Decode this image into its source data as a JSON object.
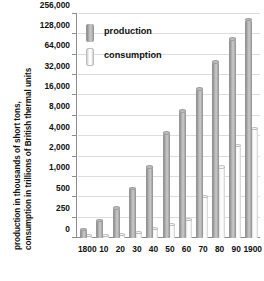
{
  "chart_data": {
    "type": "bar",
    "title": "",
    "xlabel": "",
    "ylabel": "production in thousands of short tons, consumption in trillions of British thermal units",
    "ylabel_lines": [
      "production in thousands of short tons,",
      "consumption in trillions of British thermal units"
    ],
    "scale": "log-like (custom doubling ticks)",
    "grid": true,
    "legend_position": "upper-left inside plot",
    "categories": [
      "1800",
      "10",
      "20",
      "30",
      "40",
      "50",
      "60",
      "70",
      "80",
      "90",
      "1900"
    ],
    "ytick_labels": [
      "0",
      "250",
      "500",
      "1,000",
      "2,000",
      "4,000",
      "8,000",
      "16,000",
      "32,000",
      "64,000",
      "128,000",
      "256,000"
    ],
    "ytick_values": [
      0,
      250,
      500,
      1000,
      2000,
      4000,
      8000,
      16000,
      32000,
      64000,
      128000,
      256000
    ],
    "ylim": [
      0,
      256000
    ],
    "series": [
      {
        "name": "production",
        "color": "#a8a8a8",
        "values": [
          108,
          220,
          350,
          680,
          1400,
          4500,
          9500,
          20000,
          50000,
          110000,
          212000
        ]
      },
      {
        "name": "consumption",
        "color": "#fafafa",
        "values": [
          30,
          35,
          45,
          70,
          120,
          170,
          230,
          520,
          1400,
          2900,
          5200
        ]
      }
    ]
  },
  "legend": {
    "items": [
      {
        "label": "production",
        "swatch": "production"
      },
      {
        "label": "consumption",
        "swatch": "consumption"
      }
    ]
  },
  "colors": {
    "grid": "#dcdcdc",
    "axis": "#8d8d8d",
    "text": "#111111",
    "background": "#ffffff"
  }
}
